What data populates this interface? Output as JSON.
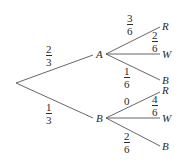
{
  "diagram": {
    "type": "probability-tree",
    "root": "",
    "level1": [
      {
        "label": "A",
        "prob": {
          "num": "2",
          "den": "3"
        }
      },
      {
        "label": "B",
        "prob": {
          "num": "1",
          "den": "3"
        }
      }
    ],
    "branchesA": [
      {
        "label": "R",
        "prob": {
          "num": "3",
          "den": "6"
        }
      },
      {
        "label": "W",
        "prob": {
          "num": "2",
          "den": "6"
        }
      },
      {
        "label": "B",
        "prob": {
          "num": "1",
          "den": "6"
        }
      }
    ],
    "branchesB": [
      {
        "label": "R",
        "prob": {
          "value": "0"
        }
      },
      {
        "label": "W",
        "prob": {
          "num": "4",
          "den": "6"
        }
      },
      {
        "label": "B",
        "prob": {
          "num": "2",
          "den": "6"
        }
      }
    ],
    "colors": {
      "line": "#555555",
      "text": "#2a2a2a"
    }
  }
}
